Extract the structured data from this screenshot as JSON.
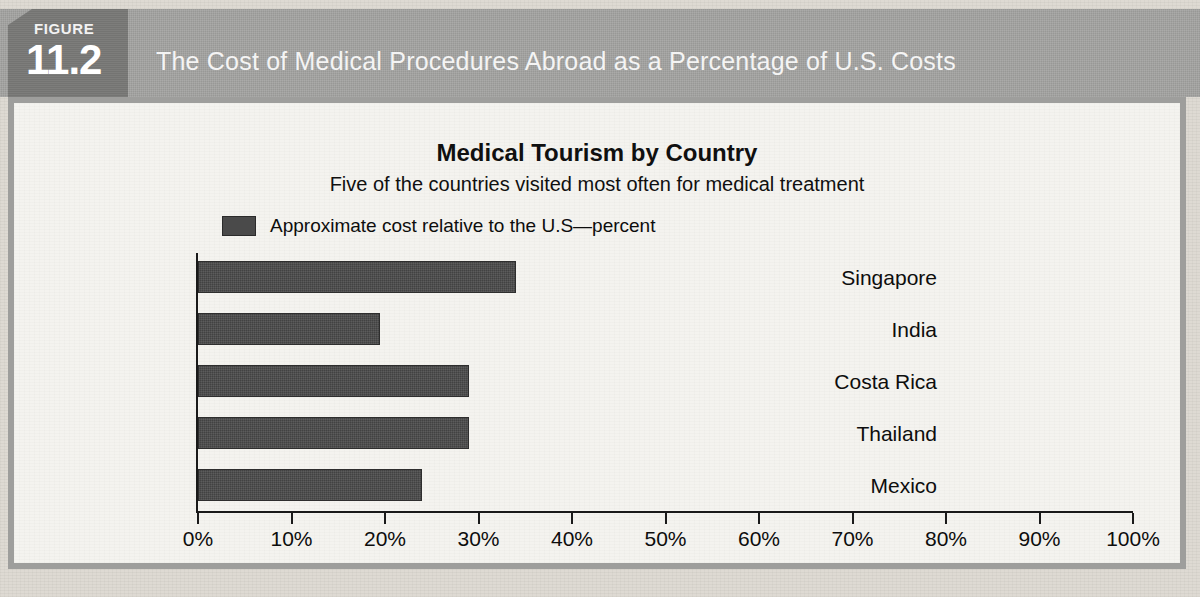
{
  "figure": {
    "badge_word": "FIGURE",
    "badge_number": "11.2",
    "title": "The Cost of Medical Procedures Abroad as a Percentage of U.S. Costs"
  },
  "colors": {
    "banner_gray": "#a2a2a0",
    "badge_gray": "#787876",
    "bar_fill": "#4a4a4a",
    "panel_background": "#f4f3ef",
    "axis": "#1a1a1a",
    "page_background": "#dedad3"
  },
  "chart_data": {
    "type": "bar",
    "orientation": "horizontal",
    "title": "Medical Tourism by Country",
    "subtitle": "Five of the countries visited most often for medical treatment",
    "categories": [
      "Singapore",
      "India",
      "Costa Rica",
      "Thailand",
      "Mexico"
    ],
    "values": [
      34,
      19.5,
      29,
      29,
      24
    ],
    "series": [
      {
        "name": "Approximate cost relative to the U.S—percent",
        "values": [
          34,
          19.5,
          29,
          29,
          24
        ]
      }
    ],
    "legend": [
      "Approximate cost relative to the U.S—percent"
    ],
    "legend_position": "top-left",
    "xlabel": "",
    "ylabel": "",
    "xlim": [
      0,
      100
    ],
    "xticks": [
      0,
      10,
      20,
      30,
      40,
      50,
      60,
      70,
      80,
      90,
      100
    ],
    "xtick_labels": [
      "0%",
      "10%",
      "20%",
      "30%",
      "40%",
      "50%",
      "60%",
      "70%",
      "80%",
      "90%",
      "100%"
    ],
    "grid": false
  }
}
